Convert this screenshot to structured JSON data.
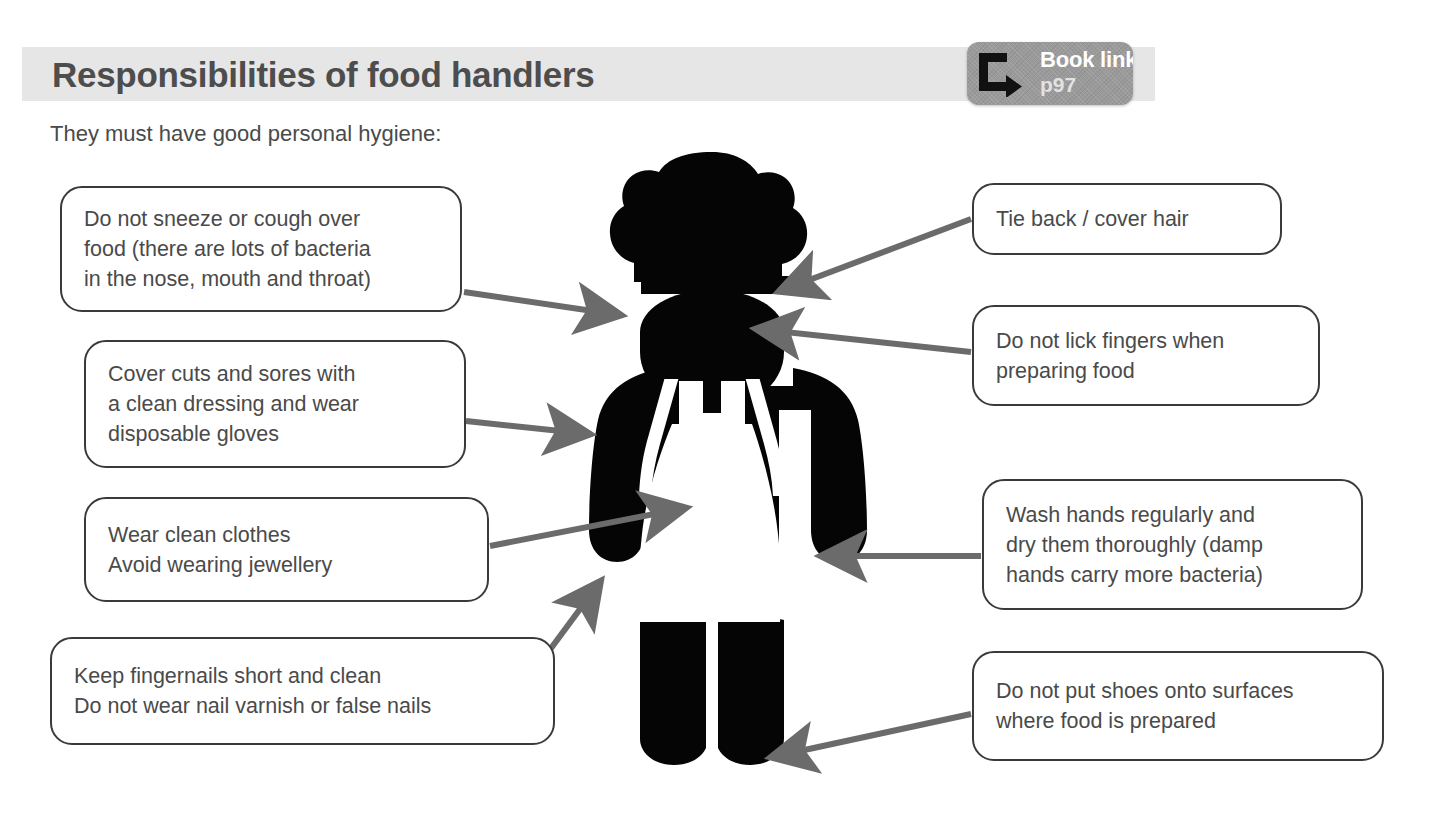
{
  "header": {
    "title": "Responsibilities of food handlers",
    "subtitle": "They must have good personal hygiene:",
    "band_color": "#e6e6e6",
    "title_color": "#4d4d4d"
  },
  "book_link": {
    "label": "Book link",
    "page": "p97",
    "icon": "hook-arrow-icon",
    "background_color": "#9a9a9a"
  },
  "figure": {
    "name": "chef-silhouette",
    "color": "#000000"
  },
  "arrow_color": "#6b6b6b",
  "callouts": {
    "left": [
      {
        "id": "sneeze",
        "text": "Do not sneeze or cough over\nfood (there are lots of bacteria\nin the nose, mouth and throat)"
      },
      {
        "id": "cuts",
        "text": "Cover cuts and sores with\na clean dressing and wear\ndisposable gloves"
      },
      {
        "id": "clothes",
        "text": "Wear clean clothes\nAvoid wearing jewellery"
      },
      {
        "id": "nails",
        "text": "Keep fingernails short and clean\nDo not wear nail varnish or false nails"
      }
    ],
    "right": [
      {
        "id": "hair",
        "text": "Tie back / cover hair"
      },
      {
        "id": "lick",
        "text": "Do not lick fingers when\npreparing food"
      },
      {
        "id": "wash",
        "text": "Wash hands regularly and\ndry them thoroughly (damp\nhands carry more bacteria)"
      },
      {
        "id": "shoes",
        "text": "Do not put shoes onto surfaces\nwhere food is prepared"
      }
    ]
  }
}
